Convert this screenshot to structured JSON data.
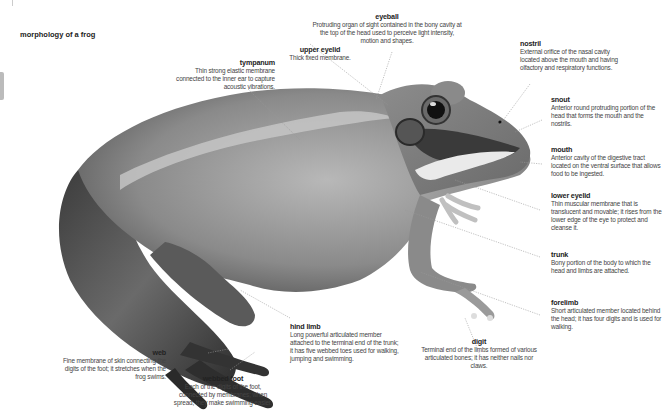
{
  "title": "morphology of a frog",
  "labels": {
    "eyeball": {
      "term": "eyeball",
      "desc": "Protruding organ of sight contained in the bony cavity at the top of the head used to perceive light intensity, motion and shapes."
    },
    "upper_eyelid": {
      "term": "upper eyelid",
      "desc": "Thick fixed membrane."
    },
    "tympanum": {
      "term": "tympanum",
      "desc": "Thin strong elastic membrane connected to the inner ear to capture acoustic vibrations."
    },
    "nostril": {
      "term": "nostril",
      "desc": "External orifice of the nasal cavity located above the mouth and having olfactory and respiratory functions."
    },
    "snout": {
      "term": "snout",
      "desc": "Anterior round protruding portion of the head that forms the mouth and the nostrils."
    },
    "mouth": {
      "term": "mouth",
      "desc": "Anterior cavity of the digestive tract located on the ventral surface that allows food to be ingested."
    },
    "lower_eyelid": {
      "term": "lower eyelid",
      "desc": "Thin muscular membrane that is translucent and movable; it rises from the lower edge of the eye to protect and cleanse it."
    },
    "trunk": {
      "term": "trunk",
      "desc": "Bony portion of the body to which the head and limbs are attached."
    },
    "forelimb": {
      "term": "forelimb",
      "desc": "Short articulated member located behind the head; it has four digits and is used for walking."
    },
    "hind_limb": {
      "term": "hind limb",
      "desc": "Long powerful articulated member attached to the terminal end of the trunk; it has five webbed toes used for walking, jumping and swimming."
    },
    "digit": {
      "term": "digit",
      "desc": "Terminal end of the limbs formed of various articulated bones; it has neither nails nor claws."
    },
    "web": {
      "term": "web",
      "desc": "Fine membrane of skin connecting the digits of the foot; it stretches when the frog swims."
    },
    "webbed_foot": {
      "term": "webbed foot",
      "desc": "Each of the digits of the foot, connected by membranes; when spread, they make swimming easier."
    }
  },
  "colors": {
    "leader_line": "#999999",
    "frog_dark": "#3a3a3a",
    "frog_mid": "#7a7a7a",
    "frog_light": "#b5b5b5"
  }
}
